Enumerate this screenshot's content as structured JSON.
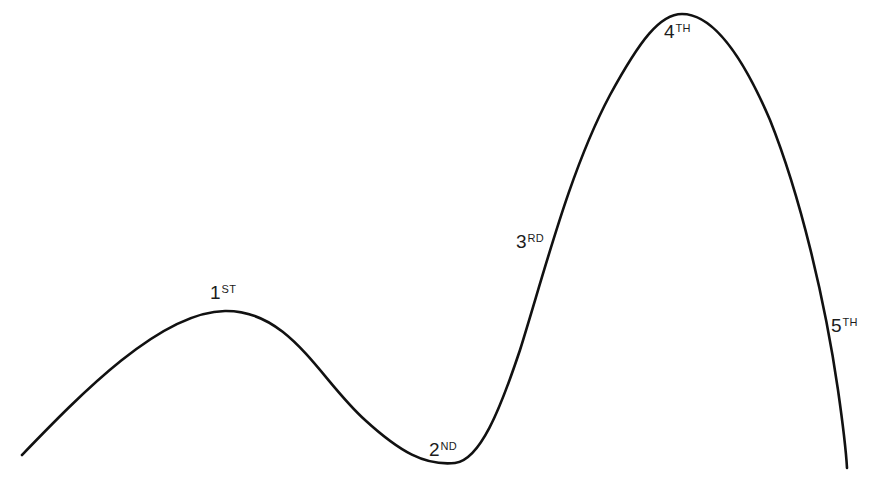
{
  "diagram": {
    "type": "wave-curve",
    "stroke_color": "#111111",
    "background_color": "#ffffff",
    "clipped_header_text": "",
    "labels": [
      {
        "id": "first",
        "number": "1",
        "suffix": "ST",
        "x": 210,
        "y": 283
      },
      {
        "id": "second",
        "number": "2",
        "suffix": "ND",
        "x": 429,
        "y": 440
      },
      {
        "id": "third",
        "number": "3",
        "suffix": "RD",
        "x": 516,
        "y": 232
      },
      {
        "id": "fourth",
        "number": "4",
        "suffix": "TH",
        "x": 664,
        "y": 24
      },
      {
        "id": "fifth",
        "number": "5",
        "suffix": "TH",
        "x": 831,
        "y": 316
      }
    ],
    "curve_points": [
      {
        "x": 22,
        "y": 455,
        "note": "start"
      },
      {
        "x": 225,
        "y": 311,
        "note": "peak 1st"
      },
      {
        "x": 445,
        "y": 464,
        "note": "trough 2nd"
      },
      {
        "x": 553,
        "y": 250,
        "note": "inflection 3rd"
      },
      {
        "x": 680,
        "y": 14,
        "note": "peak 4th"
      },
      {
        "x": 847,
        "y": 468,
        "note": "end (5th)"
      }
    ]
  }
}
